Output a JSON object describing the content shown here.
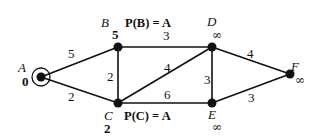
{
  "graph": {
    "nodes": [
      {
        "id": "A",
        "x": 41,
        "y": 77,
        "label": "A",
        "distance": "0",
        "source": true
      },
      {
        "id": "B",
        "x": 118,
        "y": 47,
        "label": "B",
        "distance": "5"
      },
      {
        "id": "C",
        "x": 118,
        "y": 103,
        "label": "C",
        "distance": "2"
      },
      {
        "id": "D",
        "x": 212,
        "y": 47,
        "label": "D",
        "distance": "∞"
      },
      {
        "id": "E",
        "x": 212,
        "y": 103,
        "label": "E",
        "distance": "∞"
      },
      {
        "id": "F",
        "x": 290,
        "y": 74,
        "label": "F",
        "distance": "∞"
      }
    ],
    "edges": [
      {
        "from": "A",
        "to": "B",
        "weight": "5"
      },
      {
        "from": "A",
        "to": "C",
        "weight": "2"
      },
      {
        "from": "B",
        "to": "C",
        "weight": "2"
      },
      {
        "from": "B",
        "to": "D",
        "weight": "3"
      },
      {
        "from": "C",
        "to": "D",
        "weight": "4"
      },
      {
        "from": "C",
        "to": "E",
        "weight": "6"
      },
      {
        "from": "D",
        "to": "E",
        "weight": "3"
      },
      {
        "from": "D",
        "to": "F",
        "weight": "4"
      },
      {
        "from": "E",
        "to": "F",
        "weight": "3"
      }
    ],
    "annotations": {
      "pB": "P(B) = A",
      "pC": "P(C) = A"
    }
  }
}
